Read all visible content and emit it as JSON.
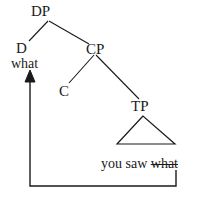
{
  "diagram": {
    "type": "syntax-tree",
    "line_color": "#1a1a1a",
    "text_color": "#1a1a1a",
    "background_color": "#ffffff"
  },
  "nodes": {
    "dp": "DP",
    "d": "D",
    "cp": "CP",
    "c": "C",
    "tp": "TP"
  },
  "terminals": {
    "what_moved": "what"
  },
  "sentence": {
    "words": "you saw ",
    "trace": "what"
  },
  "movement": {
    "label": "movement-arrow"
  }
}
